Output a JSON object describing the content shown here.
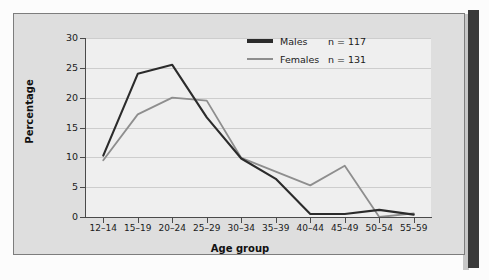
{
  "chart_data": {
    "type": "line",
    "title": "",
    "xlabel": "Age group",
    "ylabel": "Percentage",
    "categories": [
      "12–14",
      "15–19",
      "20–24",
      "25–29",
      "30–34",
      "35–39",
      "40–44",
      "45–49",
      "50–54",
      "55–59"
    ],
    "ylim": [
      0,
      30
    ],
    "yticks": [
      0,
      5,
      10,
      15,
      20,
      25,
      30
    ],
    "grid": true,
    "legend_position": "top-right",
    "series": [
      {
        "name": "Males",
        "n_label": "n = 117",
        "n": 117,
        "color": "#2b2b2b",
        "values": [
          10.3,
          24.0,
          25.5,
          16.7,
          9.8,
          6.4,
          0.5,
          0.5,
          1.2,
          0.4
        ]
      },
      {
        "name": "Females",
        "n_label": "n = 131",
        "n": 131,
        "color": "#8e8e8e",
        "values": [
          9.5,
          17.2,
          20.0,
          19.5,
          9.9,
          7.6,
          5.3,
          8.6,
          0.0,
          0.6
        ]
      }
    ]
  },
  "legend": {
    "males_label": "Males",
    "males_n": "n = 117",
    "females_label": "Females",
    "females_n": "n = 131"
  },
  "axes": {
    "y_title": "Percentage",
    "x_title": "Age group"
  }
}
